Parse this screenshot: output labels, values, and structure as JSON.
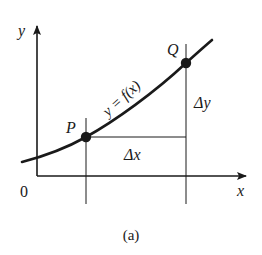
{
  "figure": {
    "caption": "(a)",
    "colors": {
      "ink": "#1a1a1a",
      "background": "#ffffff"
    },
    "axes": {
      "x_label": "x",
      "y_label": "y",
      "origin_label": "0"
    },
    "curve": {
      "label": "y = f(x)"
    },
    "points": [
      {
        "id": "P",
        "label": "P"
      },
      {
        "id": "Q",
        "label": "Q"
      }
    ],
    "increments": {
      "dx_label": "Δx",
      "dy_label": "Δy"
    }
  }
}
